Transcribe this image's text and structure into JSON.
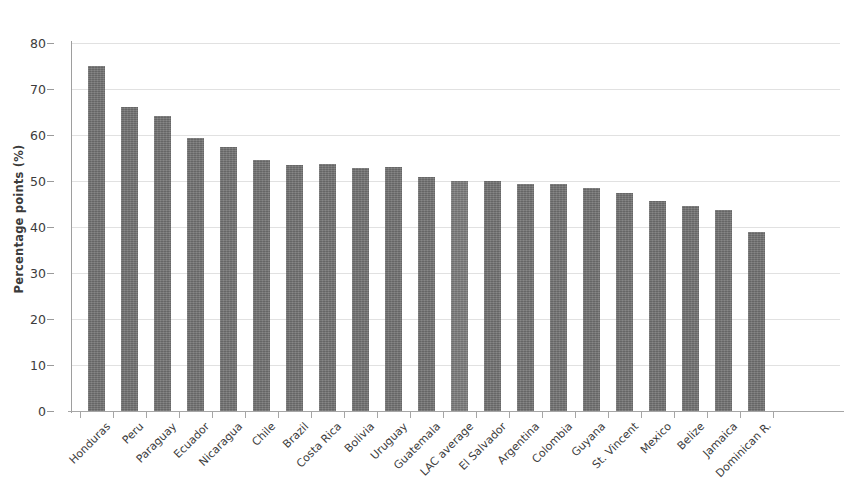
{
  "chart_data": {
    "type": "bar",
    "title": "",
    "subtitle": "",
    "xlabel": "",
    "ylabel": "Percentage points (%)",
    "ylim": [
      0,
      80
    ],
    "ytick_labels": [
      "0",
      "10",
      "20",
      "30",
      "40",
      "50",
      "60",
      "70",
      "80"
    ],
    "ytick_values": [
      0,
      10,
      20,
      30,
      40,
      50,
      60,
      70,
      80
    ],
    "grid": "horizontal",
    "legend": "none",
    "bar_color": "#6f6f6f",
    "highlight_color": "#7a7a7a",
    "highlight_category": "LAC average",
    "categories": [
      "Honduras",
      "Peru",
      "Paraguay",
      "Ecuador",
      "Nicaragua",
      "Chile",
      "Brazil",
      "Costa Rica",
      "Bolivia",
      "Uruguay",
      "Guatemala",
      "LAC average",
      "El Salvador",
      "Argentina",
      "Colombia",
      "Guyana",
      "St. Vincent",
      "Mexico",
      "Belize",
      "Jamaica",
      "Dominican R."
    ],
    "values": [
      75.0,
      66.1,
      64.2,
      59.3,
      57.3,
      54.5,
      53.5,
      53.8,
      52.8,
      53.0,
      50.9,
      50.1,
      50.1,
      49.4,
      49.3,
      48.4,
      47.4,
      45.6,
      44.6,
      43.8,
      38.9
    ]
  }
}
